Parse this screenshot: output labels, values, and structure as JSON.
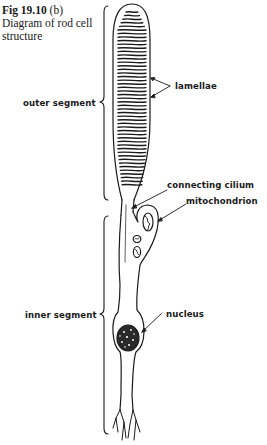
{
  "figure": {
    "number": "Fig 19.10",
    "part": "(b)",
    "caption": "Diagram of rod cell structure"
  },
  "labels": {
    "lamellae": "lamellae",
    "outer_segment": "outer segment",
    "connecting_cilium": "connecting cilium",
    "mitochondrion": "mitochondrion",
    "inner_segment": "inner segment",
    "nucleus": "nucleus"
  },
  "colors": {
    "ink": "#1a1a1a",
    "background": "#ffffff"
  }
}
